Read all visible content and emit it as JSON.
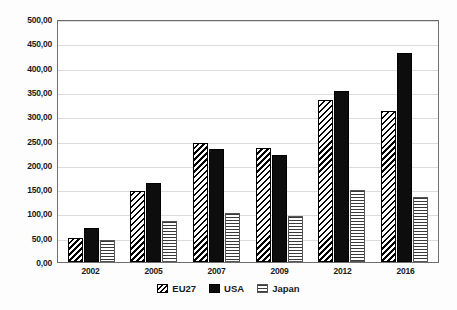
{
  "chart_data": {
    "type": "bar",
    "title": "",
    "xlabel": "",
    "ylabel": "",
    "categories": [
      "2002",
      "2005",
      "2007",
      "2009",
      "2012",
      "2016"
    ],
    "series": [
      {
        "name": "EU27",
        "pattern": "diagonal-hatch",
        "color": "#000000",
        "values": [
          50,
          147,
          245,
          234,
          333,
          310
        ]
      },
      {
        "name": "USA",
        "pattern": "solid",
        "color": "#0d0d0d",
        "values": [
          70,
          163,
          232,
          221,
          352,
          430
        ]
      },
      {
        "name": "Japan",
        "pattern": "horizontal-hatch",
        "color": "#3a3a3a",
        "values": [
          45,
          85,
          100,
          95,
          148,
          134
        ]
      }
    ],
    "ylim": [
      0,
      500
    ],
    "ytick_step": 50,
    "ytick_labels": [
      "0,00",
      "50,00",
      "100,00",
      "150,00",
      "200,00",
      "250,00",
      "300,00",
      "350,00",
      "400,00",
      "450,00",
      "500,00"
    ],
    "grid": true,
    "legend_position": "bottom",
    "decimal_separator": ","
  },
  "legend": {
    "items": [
      {
        "label": "EU27"
      },
      {
        "label": "USA"
      },
      {
        "label": "Japan"
      }
    ]
  }
}
